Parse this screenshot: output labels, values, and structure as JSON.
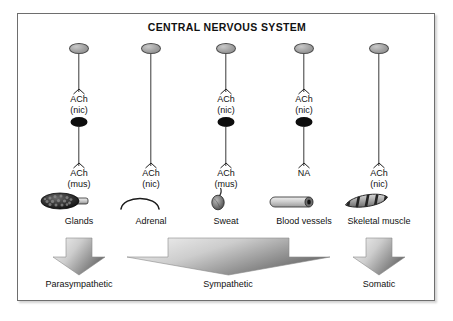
{
  "diagram": {
    "title": "CENTRAL NERVOUS SYSTEM",
    "colors": {
      "frame_border": "#6e6e6e",
      "background": "#ffffff",
      "soma_fill": "#9d9d9d",
      "ganglion_fill": "#0d0d0d",
      "axon": "#3a3a3a",
      "arrow_light": "#f2f2f2",
      "arrow_dark": "#6b6b6b",
      "text": "#111111"
    },
    "pathways": [
      {
        "id": "parasympathetic-glands",
        "x": 78,
        "preganglionic_transmitter": "ACh",
        "preganglionic_receptor": "(nic)",
        "has_ganglion": true,
        "postganglionic_transmitter": "ACh",
        "postganglionic_receptor": "(mus)",
        "organ_label": "Glands",
        "organ_icon": "gland-icon"
      },
      {
        "id": "sympathetic-adrenal",
        "x": 150,
        "preganglionic_transmitter": "ACh",
        "preganglionic_receptor": "(nic)",
        "has_ganglion": false,
        "postganglionic_transmitter": "",
        "postganglionic_receptor": "",
        "organ_label": "Adrenal",
        "organ_icon": "adrenal-icon"
      },
      {
        "id": "sympathetic-sweat",
        "x": 225,
        "preganglionic_transmitter": "ACh",
        "preganglionic_receptor": "(nic)",
        "has_ganglion": true,
        "postganglionic_transmitter": "ACh",
        "postganglionic_receptor": "(mus)",
        "organ_label": "Sweat",
        "organ_icon": "sweat-gland-icon"
      },
      {
        "id": "sympathetic-blood-vessels",
        "x": 303,
        "preganglionic_transmitter": "ACh",
        "preganglionic_receptor": "(nic)",
        "has_ganglion": true,
        "postganglionic_transmitter": "NA",
        "postganglionic_receptor": "",
        "organ_label": "Blood vessels",
        "organ_icon": "blood-vessel-icon"
      },
      {
        "id": "somatic-skeletal-muscle",
        "x": 378,
        "preganglionic_transmitter": "ACh",
        "preganglionic_receptor": "(nic)",
        "has_ganglion": false,
        "postganglionic_transmitter": "",
        "postganglionic_receptor": "",
        "organ_label": "Skeletal muscle",
        "organ_icon": "skeletal-muscle-icon"
      }
    ],
    "divisions": [
      {
        "id": "parasympathetic",
        "label": "Parasympathetic",
        "center_x": 78,
        "width": 54
      },
      {
        "id": "sympathetic",
        "label": "Sympathetic",
        "center_x": 227,
        "width": 205
      },
      {
        "id": "somatic",
        "label": "Somatic",
        "center_x": 378,
        "width": 54
      }
    ]
  }
}
